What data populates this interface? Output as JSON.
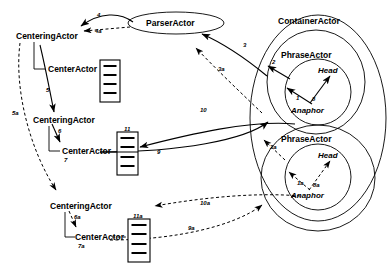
{
  "diagram": {
    "stroke_color": "#000000",
    "background_color": "#ffffff"
  },
  "nodes": {
    "parser_actor": {
      "label": "ParserActor",
      "shape": "ellipse",
      "x": 176,
      "y": 23
    },
    "container_actor": {
      "label": "ContainerActor",
      "shape": "ellipse",
      "x": 316,
      "y": 22
    },
    "phrase_actor_1": {
      "label": "PhraseActor",
      "shape": "ellipse",
      "x": 312,
      "y": 56
    },
    "phrase_actor_2": {
      "label": "PhraseActor",
      "shape": "ellipse",
      "x": 312,
      "y": 140
    },
    "head_1": {
      "label": "Head",
      "x": 325,
      "y": 72
    },
    "anaphor_1": {
      "label": "Anaphor",
      "x": 305,
      "y": 111
    },
    "head_2": {
      "label": "Head",
      "x": 325,
      "y": 157
    },
    "anaphor_2": {
      "label": "Anaphor",
      "x": 305,
      "y": 196
    }
  },
  "centering_groups": [
    {
      "centering_label": "CenteringActor",
      "center_label": "CenterActor",
      "centering_x": 16,
      "centering_y": 33,
      "center_x": 48,
      "center_y": 69,
      "box_label": "",
      "box_x": 100,
      "box_y": 60,
      "arrow_number": "",
      "tail_number": ""
    },
    {
      "centering_label": "CenteringActor",
      "center_label": "CenterActor",
      "centering_x": 33,
      "centering_y": 117,
      "center_x": 62,
      "center_y": 150,
      "box_label": "11",
      "box_x": 117,
      "box_y": 132,
      "arrow_number": "6",
      "tail_number": "7"
    },
    {
      "centering_label": "CenteringActor",
      "center_label": "CenterActor",
      "centering_x": 50,
      "centering_y": 203,
      "center_x": 75,
      "center_y": 237,
      "box_label": "11a",
      "box_x": 128,
      "box_y": 219,
      "arrow_number": "6a",
      "tail_number": "7a"
    }
  ],
  "edge_labels": [
    {
      "id": "e4",
      "text": "4",
      "x": 97,
      "y": 15,
      "style": "solid"
    },
    {
      "id": "e4a",
      "text": "4a",
      "x": 95,
      "y": 31,
      "style": "dashed"
    },
    {
      "id": "e5",
      "text": "5",
      "x": 46,
      "y": 90,
      "style": "solid"
    },
    {
      "id": "e5a",
      "text": "5a",
      "x": 12,
      "y": 113,
      "style": "dashed"
    },
    {
      "id": "e3",
      "text": "3",
      "x": 243,
      "y": 45,
      "style": "solid"
    },
    {
      "id": "e3a",
      "text": "3a",
      "x": 218,
      "y": 69,
      "style": "dashed"
    },
    {
      "id": "e2",
      "text": "2",
      "x": 272,
      "y": 62,
      "style": "solid"
    },
    {
      "id": "e1",
      "text": "1",
      "x": 296,
      "y": 98,
      "style": "solid"
    },
    {
      "id": "e8",
      "text": "8",
      "x": 312,
      "y": 99,
      "style": "solid"
    },
    {
      "id": "e2a",
      "text": "2a",
      "x": 270,
      "y": 147,
      "style": "dashed"
    },
    {
      "id": "e1a",
      "text": "1a",
      "x": 297,
      "y": 183,
      "style": "dashed"
    },
    {
      "id": "e8a",
      "text": "8a",
      "x": 313,
      "y": 185,
      "style": "dashed"
    },
    {
      "id": "e10",
      "text": "10",
      "x": 200,
      "y": 110,
      "style": "solid"
    },
    {
      "id": "e9",
      "text": "9",
      "x": 157,
      "y": 152,
      "style": "solid"
    },
    {
      "id": "e10a",
      "text": "10a",
      "x": 200,
      "y": 203,
      "style": "dashed"
    },
    {
      "id": "e9a",
      "text": "9a",
      "x": 188,
      "y": 228,
      "style": "dashed"
    }
  ],
  "list_boxes": [
    {
      "id": "box-1",
      "label": "",
      "x": 100,
      "y": 60,
      "w": 20,
      "h": 42,
      "rows": 4
    },
    {
      "id": "box-11",
      "label": "11",
      "x": 117,
      "y": 132,
      "w": 21,
      "h": 43,
      "rows": 4
    },
    {
      "id": "box-11a",
      "label": "11a",
      "x": 128,
      "y": 219,
      "w": 22,
      "h": 43,
      "rows": 4
    }
  ]
}
